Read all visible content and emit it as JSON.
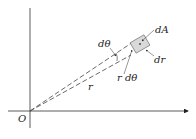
{
  "diagram": {
    "labels": {
      "origin": "O",
      "d_theta": "dθ",
      "dA": "dA",
      "dr": "dr",
      "r_dtheta": "r dθ",
      "r": "r"
    },
    "colors": {
      "axis": "#333333",
      "dashed_ray": "#444444",
      "element_fill": "#d9d9d9",
      "element_stroke": "#555555",
      "text": "#222222"
    },
    "geometry": {
      "origin": [
        30,
        111
      ],
      "x_axis": {
        "from": [
          8,
          111
        ],
        "to": [
          190,
          111
        ]
      },
      "y_axis": {
        "from": [
          30,
          8
        ],
        "to": [
          30,
          128
        ]
      },
      "ray_upper_end": [
        133,
        42
      ],
      "ray_lower_end": [
        130,
        55
      ],
      "area_element_center": [
        140,
        42
      ]
    }
  }
}
